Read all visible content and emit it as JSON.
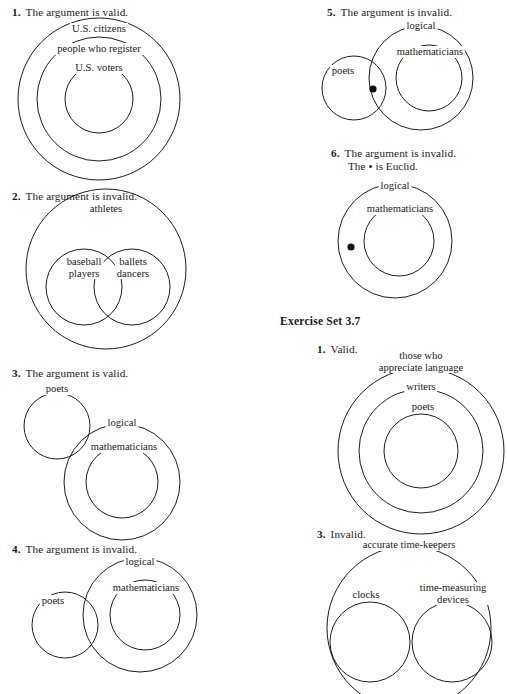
{
  "page": {
    "width": 507,
    "height": 693,
    "ink_color": "#1d1d1d",
    "paper_color": "#ffffff"
  },
  "section_heading": "Exercise Set 3.7",
  "left_column": {
    "problems": [
      {
        "number": "1.",
        "statement": "The argument is valid.",
        "labels": [
          "U.S. citizens",
          "people who register",
          "U.S. voters"
        ],
        "diagram": "three-concentric-circles"
      },
      {
        "number": "2.",
        "statement": "The argument is invalid.",
        "labels": [
          "athletes",
          "baseball players",
          "ballets dancers"
        ],
        "label_lines": {
          "baseball": [
            "baseball",
            "players"
          ],
          "ballets": [
            "ballets",
            "dancers"
          ]
        },
        "diagram": "outer-circle-with-two-overlapping-inner-circles"
      },
      {
        "number": "3.",
        "statement": "The argument is valid.",
        "labels": [
          "poets",
          "logical",
          "mathematicians"
        ],
        "diagram": "separate-circle-plus-two-concentric-circles"
      },
      {
        "number": "4.",
        "statement": "The argument is invalid.",
        "labels": [
          "logical",
          "mathematicians",
          "poets"
        ],
        "diagram": "two-concentric-circles-overlapping-one-circle"
      }
    ]
  },
  "right_column": {
    "problems": [
      {
        "number": "5.",
        "statement": "The argument is invalid.",
        "labels": [
          "logical",
          "mathematicians",
          "poets"
        ],
        "dot": true,
        "diagram": "two-concentric-circles-overlapping-one-circle-with-dot-in-lens"
      },
      {
        "number": "6.",
        "statement": "The argument is invalid.",
        "statement_line2_prefix": "The",
        "statement_line2_suffix": "is Euclid.",
        "dot_glyph": "•",
        "labels": [
          "logical",
          "mathematicians"
        ],
        "dot": true,
        "diagram": "two-concentric-circles-with-dot-in-annulus"
      }
    ],
    "exercise_set": {
      "heading": "Exercise Set 3.7",
      "problems": [
        {
          "number": "1.",
          "statement": "Valid.",
          "labels": [
            "those who appreciate language",
            "writers",
            "poets"
          ],
          "label_lines": {
            "outer": [
              "those who",
              "appreciate language"
            ]
          },
          "diagram": "three-concentric-circles"
        },
        {
          "number": "3.",
          "statement": "Invalid.",
          "labels": [
            "accurate time-keepers",
            "clocks",
            "time-measuring devices"
          ],
          "label_lines": {
            "right_inner": [
              "time-measuring",
              "devices"
            ]
          },
          "diagram": "outer-circle-with-two-tangent-inner-circles"
        }
      ]
    }
  }
}
